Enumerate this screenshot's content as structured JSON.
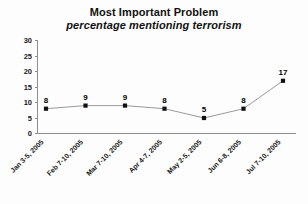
{
  "chart_data": {
    "type": "line",
    "title": "Most Important Problem",
    "subtitle": "percentage mentioning terrorism",
    "xlabel": "",
    "ylabel": "",
    "ylim": [
      0,
      30
    ],
    "yticks": [
      0,
      5,
      10,
      15,
      20,
      25,
      30
    ],
    "ytick_labels": [
      "0",
      "5",
      "10",
      "15",
      "20",
      "25",
      "30"
    ],
    "grid": false,
    "legend": false,
    "marker": "square",
    "data_labels": true,
    "categories": [
      "Jan 3-5, 2005",
      "Feb 7-10, 2005",
      "Mar 7-10, 2005",
      "Apr 4-7, 2005",
      "May 2-5, 2005",
      "Jun 6-8, 2005",
      "Jul 7-10, 2005"
    ],
    "values": [
      8,
      9,
      9,
      8,
      5,
      8,
      17
    ],
    "value_labels": [
      "8",
      "9",
      "9",
      "8",
      "5",
      "8",
      "17"
    ],
    "series": [
      {
        "name": "percentage mentioning terrorism",
        "values": [
          8,
          9,
          9,
          8,
          5,
          8,
          17
        ]
      }
    ],
    "colors": {
      "line": "#9a9a9a",
      "marker": "#111111",
      "axis": "#8d8d8d",
      "text": "#111111",
      "background": "#fdfdfd"
    }
  }
}
